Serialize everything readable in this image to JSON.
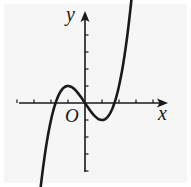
{
  "figure": {
    "x_axis_label": "x",
    "y_axis_label": "y",
    "origin_label": "O",
    "background_color": "#f6f6f6",
    "stroke_color": "#1a1a1a"
  },
  "chart_data": {
    "type": "line",
    "title": "",
    "xlabel": "x",
    "ylabel": "y",
    "function_shape": "cubic with local maximum near x=-1 (y≈1) and local minimum near x=1 (y≈-1), passing through origin",
    "x_ticks_left": 4,
    "x_ticks_right": 4,
    "y_ticks_up": 4,
    "y_ticks_down": 4,
    "xlim": [
      -4,
      5
    ],
    "ylim": [
      -4,
      5
    ],
    "zeros": [
      -1.73,
      0,
      1.73
    ],
    "local_max": [
      -1,
      1
    ],
    "local_min": [
      1,
      -1
    ],
    "curve_x_range": [
      -2.95,
      2.85
    ],
    "grid": false
  }
}
